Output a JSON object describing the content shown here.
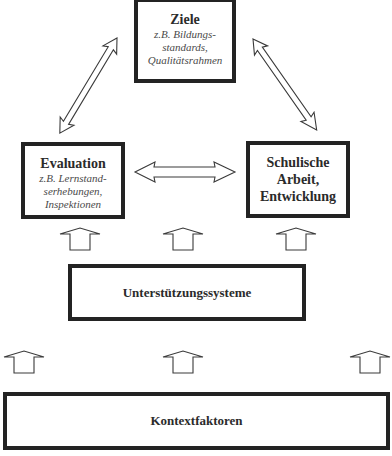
{
  "diagram": {
    "boxes": {
      "ziele": {
        "title": "Ziele",
        "subtitle_lines": [
          "z.B. Bildungs-",
          "standards,",
          "Qualitätsrahmen"
        ]
      },
      "evaluation": {
        "title": "Evaluation",
        "subtitle_lines": [
          "z.B. Lernstand-",
          "serhebungen,",
          "Inspektionen"
        ]
      },
      "schulische_arbeit": {
        "title_lines": [
          "Schulische",
          "Arbeit,",
          "Entwicklung"
        ]
      },
      "unterstuetzungssysteme": {
        "title": "Unterstützungssysteme"
      },
      "kontextfaktoren": {
        "title": "Kontextfaktoren"
      }
    },
    "connections": [
      {
        "from": "Ziele",
        "to": "Evaluation",
        "type": "double-arrow"
      },
      {
        "from": "Ziele",
        "to": "Schulische Arbeit, Entwicklung",
        "type": "double-arrow"
      },
      {
        "from": "Evaluation",
        "to": "Schulische Arbeit, Entwicklung",
        "type": "double-arrow"
      },
      {
        "from": "Unterstützungssysteme",
        "to": "Evaluation / Schulische Arbeit",
        "type": "up-arrow",
        "count": 3
      },
      {
        "from": "Kontextfaktoren",
        "to": "Unterstützungssysteme / whole system",
        "type": "up-arrow",
        "count": 3
      }
    ],
    "colors": {
      "border": "#232323",
      "text": "#2b2b2b",
      "subtitle": "#4a4a4a",
      "background": "#ffffff"
    }
  }
}
